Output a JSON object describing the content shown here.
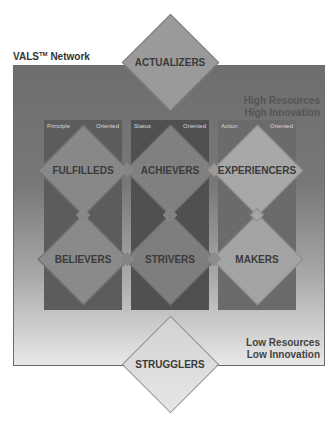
{
  "title": {
    "text": "VALS",
    "tm": "TM",
    "suffix": " Network"
  },
  "corners": {
    "high_resources": "High Resources",
    "high_innovation": "High Innovation",
    "low_resources": "Low Resources",
    "low_innovation": "Low Innovation"
  },
  "columns": [
    {
      "left": "Principle",
      "right": "Oriented",
      "color": "#5c5c5c"
    },
    {
      "left": "Status",
      "right": "Oriented",
      "color": "#505050"
    },
    {
      "left": "Action",
      "right": "Oriented",
      "color": "#6b6b6b"
    }
  ],
  "segments": {
    "top": "ACTUALIZERS",
    "row1": [
      "FULFILLEDS",
      "ACHIEVERS",
      "EXPERIENCERS"
    ],
    "row2": [
      "BELIEVERS",
      "STRIVERS",
      "MAKERS"
    ],
    "bottom": "STRUGGLERS"
  },
  "colors": {
    "actualizers": "#9a9a9a",
    "fulfilleds": "#888888",
    "achievers": "#808080",
    "experiencers": "#a8a8a8",
    "believers": "#8a8a8a",
    "strivers": "#7e7e7e",
    "makers": "#a4a4a4",
    "strugglers": "#dcdcdc"
  }
}
